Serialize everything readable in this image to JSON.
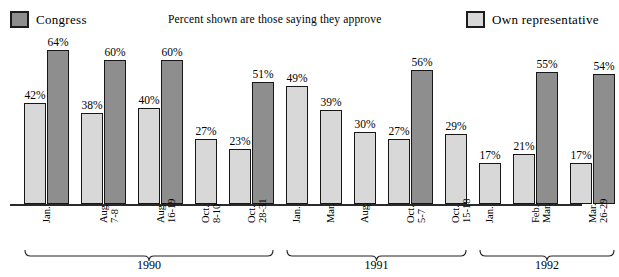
{
  "legend": {
    "congress": {
      "label": "Congress",
      "color": "#8e8e8e",
      "swatch_name": "congress-swatch"
    },
    "own": {
      "label": "Own  representative",
      "color": "#d8d8d8",
      "swatch_name": "own-representative-swatch"
    }
  },
  "subtitle": "Percent shown are those saying they approve",
  "years": [
    {
      "label": "1990",
      "start_index": 0,
      "end_index": 4
    },
    {
      "label": "1991",
      "start_index": 5,
      "end_index": 9
    },
    {
      "label": "1992",
      "start_index": 10,
      "end_index": 12
    }
  ],
  "groups": [
    {
      "tick": [
        "Jan."
      ],
      "congress": "42%",
      "own": "64%"
    },
    {
      "tick": [
        "Aug.",
        "7-8"
      ],
      "congress": "38%",
      "own": "60%"
    },
    {
      "tick": [
        "Aug.",
        "16-19"
      ],
      "congress": "40%",
      "own": "60%"
    },
    {
      "tick": [
        "Oct.",
        "8-10"
      ],
      "congress": "27%",
      "own": null
    },
    {
      "tick": [
        "Oct.",
        "28-31"
      ],
      "congress": "23%",
      "own": "51%"
    },
    {
      "tick": [
        "Jan."
      ],
      "congress": "49%",
      "own": null
    },
    {
      "tick": [
        "Mar."
      ],
      "congress": "39%",
      "own": null
    },
    {
      "tick": [
        "Aug."
      ],
      "congress": "30%",
      "own": null
    },
    {
      "tick": [
        "Oct.",
        "5-7"
      ],
      "congress": "27%",
      "own": "56%"
    },
    {
      "tick": [
        "Oct.",
        "15-18"
      ],
      "congress": "29%",
      "own": null
    },
    {
      "tick": [
        "Jan."
      ],
      "congress": "17%",
      "own": null
    },
    {
      "tick": [
        "Feb.-",
        "Mar."
      ],
      "congress": "21%",
      "own": "55%"
    },
    {
      "tick": [
        "Mar.",
        "26-29"
      ],
      "congress": "17%",
      "own": "54%"
    }
  ],
  "chart_data": {
    "type": "bar",
    "title": "",
    "subtitle": "Percent shown are those saying they approve",
    "xlabel": "",
    "ylabel": "",
    "ylim": [
      0,
      70
    ],
    "grid": false,
    "legend_position": "top",
    "categories": [
      "1990 Jan.",
      "1990 Aug. 7-8",
      "1990 Aug. 16-19",
      "1990 Oct. 8-10",
      "1990 Oct. 28-31",
      "1991 Jan.",
      "1991 Mar.",
      "1991 Aug.",
      "1991 Oct. 5-7",
      "1991 Oct. 15-18",
      "1992 Jan.",
      "1992 Feb.-Mar.",
      "1992 Mar. 26-29"
    ],
    "series": [
      {
        "name": "Congress",
        "color": "#d8d8d8",
        "values": [
          42,
          38,
          40,
          27,
          23,
          49,
          39,
          30,
          27,
          29,
          17,
          21,
          17
        ]
      },
      {
        "name": "Own representative",
        "color": "#8e8e8e",
        "values": [
          64,
          60,
          60,
          null,
          51,
          null,
          null,
          null,
          56,
          null,
          null,
          55,
          54
        ]
      }
    ],
    "group_brackets": [
      {
        "label": "1990",
        "categories": [
          "1990 Jan.",
          "1990 Aug. 7-8",
          "1990 Aug. 16-19",
          "1990 Oct. 8-10",
          "1990 Oct. 28-31"
        ]
      },
      {
        "label": "1991",
        "categories": [
          "1991 Jan.",
          "1991 Mar.",
          "1991 Aug.",
          "1991 Oct. 5-7",
          "1991 Oct. 15-18"
        ]
      },
      {
        "label": "1992",
        "categories": [
          "1992 Jan.",
          "1992 Feb.-Mar.",
          "1992 Mar. 26-29"
        ]
      }
    ]
  }
}
